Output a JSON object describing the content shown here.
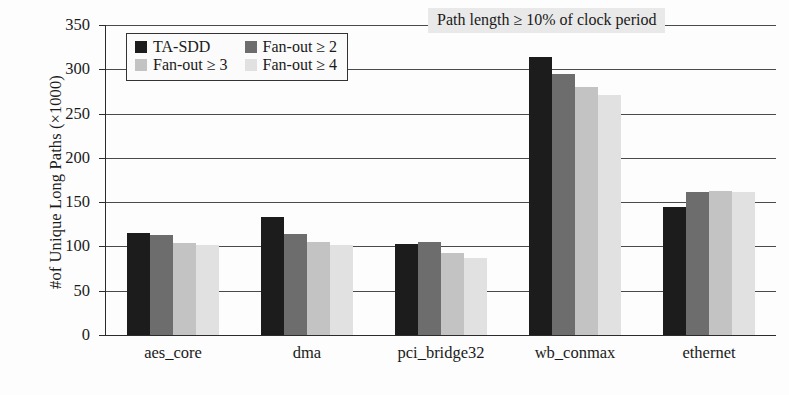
{
  "chart_data": {
    "type": "bar",
    "title": "",
    "subtitle": "",
    "xlabel": "",
    "ylabel": "#of Unique Long Paths (×1000)",
    "ylim": [
      0,
      350
    ],
    "ytick_step": 50,
    "yticks": [
      "350",
      "300",
      "250",
      "200",
      "150",
      "100",
      "50",
      "0"
    ],
    "ytick_values": [
      350,
      300,
      250,
      200,
      150,
      100,
      50,
      0
    ],
    "grid": true,
    "grid_axis": "y",
    "legend_position": "top-left-inside",
    "categories": [
      "aes_core",
      "dma",
      "pci_bridge32",
      "wb_conmax",
      "ethernet"
    ],
    "series": [
      {
        "name": "TA-SDD",
        "color": "#1c1c1c",
        "values": [
          115,
          133,
          103,
          314,
          144
        ]
      },
      {
        "name": "Fan-out ≥ 2",
        "color": "#6d6d6d",
        "values": [
          113,
          114,
          105,
          295,
          161
        ]
      },
      {
        "name": "Fan-out ≥ 3",
        "color": "#c3c3c3",
        "values": [
          104,
          105,
          93,
          280,
          163
        ]
      },
      {
        "name": "Fan-out ≥ 4",
        "color": "#e1e1e1",
        "values": [
          102,
          102,
          87,
          271,
          161
        ]
      }
    ],
    "annotations": [
      {
        "text": "Path length ≥ 10% of clock period",
        "position": "top-right",
        "background": "#e9e9e9"
      }
    ]
  }
}
